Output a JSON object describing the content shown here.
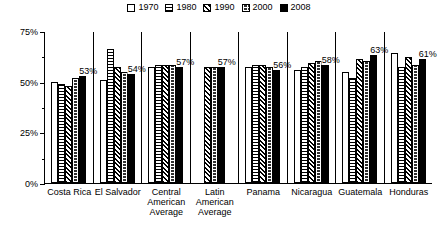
{
  "legend": {
    "position": "top-center",
    "items": [
      {
        "label": "1970",
        "pattern": "empty",
        "swatch_name": "legend-swatch-1970"
      },
      {
        "label": "1980",
        "pattern": "wave",
        "swatch_name": "legend-swatch-1980"
      },
      {
        "label": "1990",
        "pattern": "diag",
        "swatch_name": "legend-swatch-1990"
      },
      {
        "label": "2000",
        "pattern": "dot",
        "swatch_name": "legend-swatch-2000"
      },
      {
        "label": "2008",
        "pattern": "solid",
        "swatch_name": "legend-swatch-2008"
      }
    ]
  },
  "axis": {
    "y_ticks": [
      "75%",
      "50%",
      "25%",
      "0%"
    ],
    "y_tick_values": [
      75,
      50,
      25,
      0
    ],
    "y_minor_count": 4
  },
  "chart_data": {
    "type": "bar",
    "title": "",
    "subtitle": "",
    "xlabel": "",
    "ylabel": "",
    "ylim": [
      0,
      75
    ],
    "yticks": [
      0,
      25,
      50,
      75
    ],
    "ytick_labels": [
      "0%",
      "25%",
      "50%",
      "75%"
    ],
    "grid": false,
    "legend_position": "top-center",
    "value_suffix": "%",
    "labeled_series": "2008",
    "categories": [
      "Costa Rica",
      "El Salvador",
      "Central\nAmerican\nAverage",
      "Latin\nAmerican\nAverage",
      "Panama",
      "Nicaragua",
      "Guatemala",
      "Honduras"
    ],
    "series": [
      {
        "name": "1970",
        "pattern": "empty",
        "values": [
          50,
          51,
          57,
          null,
          57,
          56,
          55,
          64
        ]
      },
      {
        "name": "1980",
        "pattern": "wave",
        "values": [
          49,
          66,
          58,
          null,
          58,
          57,
          52,
          57
        ]
      },
      {
        "name": "1990",
        "pattern": "diag",
        "values": [
          48,
          57,
          58,
          57,
          58,
          59,
          61,
          62
        ]
      },
      {
        "name": "2000",
        "pattern": "dot",
        "values": [
          52,
          55,
          58,
          57,
          57,
          60,
          60,
          58
        ]
      },
      {
        "name": "2008",
        "pattern": "solid",
        "values": [
          53,
          54,
          57,
          57,
          56,
          58,
          63,
          61
        ]
      }
    ],
    "data_labels": [
      {
        "category": "Costa Rica",
        "series": "2008",
        "text": "53%"
      },
      {
        "category": "El Salvador",
        "series": "2008",
        "text": "54%"
      },
      {
        "category": "Central American Average",
        "series": "2008",
        "text": "57%"
      },
      {
        "category": "Latin American Average",
        "series": "2008",
        "text": "57%"
      },
      {
        "category": "Panama",
        "series": "2008",
        "text": "56%"
      },
      {
        "category": "Nicaragua",
        "series": "2008",
        "text": "58%"
      },
      {
        "category": "Guatemala",
        "series": "2008",
        "text": "63%"
      },
      {
        "category": "Honduras",
        "series": "2008",
        "text": "61%"
      }
    ]
  },
  "colors": {
    "ink": "#000000",
    "background": "#ffffff"
  }
}
